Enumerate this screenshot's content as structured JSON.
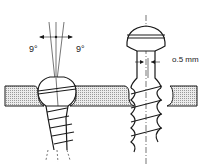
{
  "diagram": {
    "left_screw": {
      "angle_left_label": "9°",
      "angle_right_label": "9°"
    },
    "right_screw": {
      "clearance_label": "o.5 mm"
    }
  },
  "colors": {
    "line": "#1a1a1a",
    "plate_fill": "#d9d9d9",
    "background": "#ffffff"
  }
}
